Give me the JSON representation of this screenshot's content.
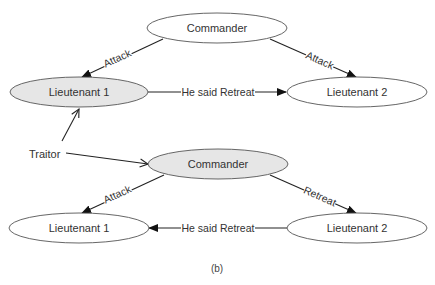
{
  "colors": {
    "traitor_fill": "#e6e6e6",
    "loyal_fill": "#ffffff",
    "outline": "#555555",
    "edge": "#222222",
    "text": "#333333"
  },
  "scenario_top": {
    "nodes": {
      "commander": {
        "label": "Commander",
        "traitor": false
      },
      "lieutenant1": {
        "label": "Lieutenant 1",
        "traitor": true
      },
      "lieutenant2": {
        "label": "Lieutenant 2",
        "traitor": false
      }
    },
    "edges": [
      {
        "from": "Commander",
        "to": "Lieutenant 1",
        "label": "Attack"
      },
      {
        "from": "Commander",
        "to": "Lieutenant 2",
        "label": "Attack"
      },
      {
        "from": "Lieutenant 1",
        "to": "Lieutenant 2",
        "label": "He said Retreat"
      }
    ]
  },
  "scenario_bottom": {
    "nodes": {
      "commander": {
        "label": "Commander",
        "traitor": true
      },
      "lieutenant1": {
        "label": "Lieutenant 1",
        "traitor": false
      },
      "lieutenant2": {
        "label": "Lieutenant 2",
        "traitor": false
      }
    },
    "edges": [
      {
        "from": "Commander",
        "to": "Lieutenant 1",
        "label": "Attack"
      },
      {
        "from": "Commander",
        "to": "Lieutenant 2",
        "label": "Retreat"
      },
      {
        "from": "Lieutenant 2",
        "to": "Lieutenant 1",
        "label": "He said Retreat"
      }
    ]
  },
  "traitor_annotation": {
    "label": "Traitor",
    "points_to": [
      "Lieutenant 1 (top)",
      "Commander (bottom)"
    ]
  },
  "caption": "(b)"
}
